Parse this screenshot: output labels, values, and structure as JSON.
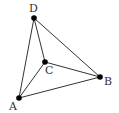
{
  "diagram": {
    "type": "tetrahedron-graph",
    "vertices": [
      {
        "id": "A",
        "label": "A",
        "x": 19,
        "y": 98,
        "lx": 9,
        "ly": 110
      },
      {
        "id": "B",
        "label": "B",
        "x": 100,
        "y": 77,
        "lx": 104,
        "ly": 85
      },
      {
        "id": "C",
        "label": "C",
        "x": 45,
        "y": 62,
        "lx": 45,
        "ly": 74
      },
      {
        "id": "D",
        "label": "D",
        "x": 34,
        "y": 18,
        "lx": 29,
        "ly": 12
      }
    ],
    "edges": [
      {
        "from": "D",
        "to": "A"
      },
      {
        "from": "D",
        "to": "B"
      },
      {
        "from": "D",
        "to": "C"
      },
      {
        "from": "C",
        "to": "A"
      },
      {
        "from": "C",
        "to": "B"
      },
      {
        "from": "A",
        "to": "B"
      }
    ],
    "colors": {
      "line": "#333333",
      "dot": "#000000",
      "background": "#ffffff"
    }
  }
}
